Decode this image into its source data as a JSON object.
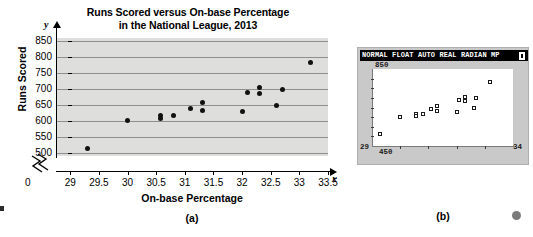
{
  "figure": {
    "panel_a_caption": "(a)",
    "panel_b_caption": "(b)"
  },
  "chart_data": {
    "type": "scatter",
    "title": "Runs Scored versus On-base Percentage in the National League, 2013",
    "title_line1": "Runs Scored versus On-base Percentage",
    "title_line2": "in the National League, 2013",
    "xlabel": "On-base Percentage",
    "ylabel": "Runs Scored",
    "x_var_symbol": "x",
    "y_var_symbol": "y",
    "origin_label": "0",
    "axis_break": true,
    "grid": true,
    "xlim": [
      28.75,
      33.5
    ],
    "ylim": [
      490,
      860
    ],
    "xticks": [
      29,
      29.5,
      30,
      30.5,
      31,
      31.5,
      32,
      32.5,
      33,
      33.5
    ],
    "xtick_labels": [
      "29",
      "29.5",
      "30",
      "30.5",
      "31",
      "31.5",
      "32",
      "32.5",
      "33",
      "33.5"
    ],
    "yticks": [
      500,
      550,
      600,
      650,
      700,
      750,
      800,
      850
    ],
    "ytick_labels": [
      "500",
      "550",
      "600",
      "650",
      "700",
      "750",
      "800",
      "850"
    ],
    "points": [
      {
        "x": 29.3,
        "y": 513
      },
      {
        "x": 30.0,
        "y": 602
      },
      {
        "x": 30.57,
        "y": 616
      },
      {
        "x": 30.57,
        "y": 608
      },
      {
        "x": 30.8,
        "y": 618
      },
      {
        "x": 31.1,
        "y": 640
      },
      {
        "x": 31.3,
        "y": 658
      },
      {
        "x": 31.3,
        "y": 634
      },
      {
        "x": 32.0,
        "y": 628
      },
      {
        "x": 32.1,
        "y": 688
      },
      {
        "x": 32.3,
        "y": 706
      },
      {
        "x": 32.3,
        "y": 686
      },
      {
        "x": 32.6,
        "y": 649
      },
      {
        "x": 32.7,
        "y": 699
      },
      {
        "x": 33.2,
        "y": 783
      }
    ]
  },
  "calculator": {
    "status_bar": "NORMAL FLOAT AUTO REAL RADIAN MP",
    "battery_icon": "battery-icon",
    "window": {
      "ymax_label": "850",
      "ymin_label": "450",
      "xmin_label": "29",
      "xmax_label": "34"
    },
    "plot": {
      "type": "scatter",
      "xlim": [
        29,
        34
      ],
      "ylim": [
        450,
        850
      ],
      "points": [
        {
          "x": 29.3,
          "y": 513
        },
        {
          "x": 30.0,
          "y": 602
        },
        {
          "x": 30.57,
          "y": 616
        },
        {
          "x": 30.57,
          "y": 608
        },
        {
          "x": 30.8,
          "y": 618
        },
        {
          "x": 31.1,
          "y": 640
        },
        {
          "x": 31.3,
          "y": 658
        },
        {
          "x": 31.3,
          "y": 634
        },
        {
          "x": 32.0,
          "y": 628
        },
        {
          "x": 32.1,
          "y": 688
        },
        {
          "x": 32.3,
          "y": 706
        },
        {
          "x": 32.3,
          "y": 686
        },
        {
          "x": 32.6,
          "y": 649
        },
        {
          "x": 32.7,
          "y": 699
        },
        {
          "x": 33.2,
          "y": 783
        }
      ]
    }
  }
}
